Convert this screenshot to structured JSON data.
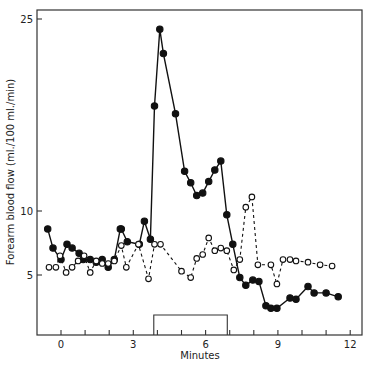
{
  "chart_data": {
    "type": "line",
    "title": "",
    "xlabel": "Minutes",
    "ylabel": "Forearm blood flow (ml./100 ml./min)",
    "xlim": [
      -1,
      12.5
    ],
    "ylim": [
      0,
      26
    ],
    "x_ticks": [
      0,
      1,
      2,
      3,
      4,
      5,
      6,
      7,
      8,
      9,
      10,
      11,
      12
    ],
    "x_tick_labels": [
      {
        "value": 0,
        "label": "0"
      },
      {
        "value": 3,
        "label": "3"
      },
      {
        "value": 6,
        "label": "6"
      },
      {
        "value": 9,
        "label": "9"
      },
      {
        "value": 12,
        "label": "12"
      }
    ],
    "y_tick_labels": [
      {
        "value": 5,
        "label": "5"
      },
      {
        "value": 10,
        "label": "10"
      },
      {
        "value": 25,
        "label": "25"
      }
    ],
    "grid": false,
    "legend": null,
    "annotations": [
      {
        "type": "bracket",
        "label": "stimulus period",
        "x_start": 3.85,
        "x_end": 6.9
      }
    ],
    "series": [
      {
        "name": "filled",
        "marker": "filled-circle",
        "line": "solid",
        "color": "#111111",
        "x": [
          -0.55,
          -0.33,
          0.0,
          0.25,
          0.46,
          0.75,
          0.92,
          1.21,
          1.46,
          1.71,
          1.96,
          2.21,
          2.46,
          2.5,
          2.75,
          3.25,
          3.46,
          3.71,
          3.88,
          4.1,
          4.25,
          4.75,
          5.13,
          5.38,
          5.63,
          5.88,
          6.13,
          6.38,
          6.63,
          6.88,
          7.13,
          7.42,
          7.67,
          7.96,
          8.21,
          8.5,
          8.71,
          8.96,
          9.5,
          9.75,
          10.25,
          10.5,
          11.0,
          11.5
        ],
        "values": [
          8.6,
          7.1,
          6.2,
          7.4,
          7.1,
          6.7,
          6.2,
          6.2,
          6.0,
          6.2,
          5.6,
          6.2,
          8.6,
          8.6,
          7.6,
          7.4,
          9.2,
          7.8,
          18.2,
          24.2,
          22.3,
          17.6,
          13.1,
          12.2,
          11.2,
          11.4,
          12.3,
          13.2,
          13.9,
          9.7,
          7.4,
          4.8,
          4.2,
          4.6,
          4.5,
          2.6,
          2.4,
          2.4,
          3.2,
          3.1,
          4.1,
          3.6,
          3.6,
          3.3
        ]
      },
      {
        "name": "open",
        "marker": "open-circle",
        "line": "dashed",
        "color": "#111111",
        "x": [
          -0.5,
          -0.21,
          -0.04,
          0.21,
          0.46,
          0.71,
          0.96,
          1.21,
          1.46,
          1.71,
          1.96,
          2.21,
          2.5,
          2.71,
          3.21,
          3.63,
          3.88,
          4.13,
          5.0,
          5.38,
          5.63,
          5.88,
          6.13,
          6.38,
          6.63,
          6.88,
          7.17,
          7.42,
          7.67,
          7.92,
          8.17,
          8.71,
          8.96,
          9.21,
          9.5,
          9.75,
          10.25,
          10.75,
          11.25
        ],
        "values": [
          5.6,
          5.6,
          6.5,
          5.2,
          5.6,
          6.1,
          6.5,
          5.2,
          6.1,
          5.9,
          5.9,
          6.1,
          7.3,
          5.6,
          7.4,
          4.7,
          7.4,
          7.4,
          5.3,
          4.8,
          6.3,
          6.6,
          7.9,
          6.9,
          7.1,
          6.9,
          5.4,
          6.2,
          10.3,
          11.1,
          5.8,
          5.8,
          4.3,
          6.2,
          6.2,
          6.1,
          6.0,
          5.8,
          5.7
        ]
      }
    ]
  }
}
